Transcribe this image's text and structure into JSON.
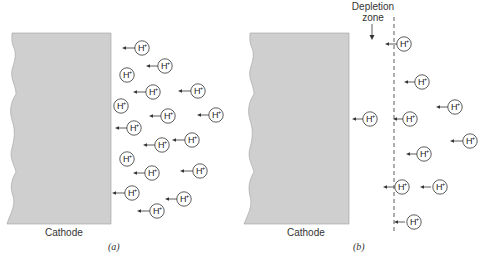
{
  "figure": {
    "colors": {
      "cathode_fill": "#cfcfcf",
      "cathode_edge": "#9a9a9a",
      "stroke": "#333333",
      "text": "#333333"
    },
    "ion_label": "H",
    "ion_charge": "+",
    "panels": [
      {
        "id": "a",
        "caption": "(a)",
        "cathode_label": "Cathode",
        "cathode": {
          "x": 7,
          "y": 33,
          "right": 111,
          "bottom": 224
        },
        "ions": [
          {
            "x": 142,
            "y": 48,
            "arrow_from": 135,
            "arrow_to": 122
          },
          {
            "x": 165,
            "y": 66,
            "arrow_from": 159,
            "arrow_to": 146
          },
          {
            "x": 127,
            "y": 75
          },
          {
            "x": 153,
            "y": 92,
            "arrow_from": 147,
            "arrow_to": 133
          },
          {
            "x": 198,
            "y": 91,
            "arrow_from": 192,
            "arrow_to": 178
          },
          {
            "x": 121,
            "y": 106
          },
          {
            "x": 168,
            "y": 116,
            "arrow_from": 162,
            "arrow_to": 149
          },
          {
            "x": 216,
            "y": 115,
            "arrow_from": 210,
            "arrow_to": 197
          },
          {
            "x": 134,
            "y": 128,
            "arrow_from": 128,
            "arrow_to": 115
          },
          {
            "x": 162,
            "y": 145,
            "arrow_from": 156,
            "arrow_to": 143
          },
          {
            "x": 192,
            "y": 140,
            "arrow_from": 185,
            "arrow_to": 172
          },
          {
            "x": 127,
            "y": 159
          },
          {
            "x": 152,
            "y": 173,
            "arrow_from": 146,
            "arrow_to": 133
          },
          {
            "x": 200,
            "y": 171,
            "arrow_from": 193,
            "arrow_to": 180
          },
          {
            "x": 132,
            "y": 193,
            "arrow_from": 126,
            "arrow_to": 112
          },
          {
            "x": 184,
            "y": 199,
            "arrow_from": 178,
            "arrow_to": 165
          },
          {
            "x": 157,
            "y": 211,
            "arrow_from": 151,
            "arrow_to": 137
          }
        ]
      },
      {
        "id": "b",
        "caption": "(b)",
        "cathode_label": "Cathode",
        "depletion_label_line1": "Depletion",
        "depletion_label_line2": "zone",
        "dashed_line_x": 394,
        "cathode": {
          "x": 250,
          "y": 33,
          "right": 349,
          "bottom": 224
        },
        "ions": [
          {
            "x": 404,
            "y": 44,
            "arrow_from": 397,
            "arrow_to": 385
          },
          {
            "x": 422,
            "y": 82,
            "arrow_from": 416,
            "arrow_to": 404
          },
          {
            "x": 455,
            "y": 107,
            "arrow_from": 448,
            "arrow_to": 436
          },
          {
            "x": 370,
            "y": 119,
            "arrow_from": 364,
            "arrow_to": 352
          },
          {
            "x": 410,
            "y": 119,
            "arrow_from": 404,
            "arrow_to": 393
          },
          {
            "x": 470,
            "y": 141,
            "arrow_from": 463,
            "arrow_to": 450
          },
          {
            "x": 424,
            "y": 154,
            "arrow_from": 418,
            "arrow_to": 406
          },
          {
            "x": 402,
            "y": 187,
            "arrow_from": 394,
            "arrow_to": 383
          },
          {
            "x": 440,
            "y": 187,
            "arrow_from": 431,
            "arrow_to": 420
          },
          {
            "x": 414,
            "y": 222,
            "arrow_from": 405,
            "arrow_to": 394
          }
        ]
      }
    ]
  }
}
